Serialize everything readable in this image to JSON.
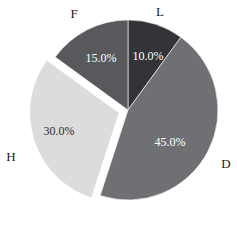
{
  "chart_data": {
    "type": "pie",
    "title": "",
    "categories": [
      "L",
      "D",
      "H",
      "F"
    ],
    "values": [
      10.0,
      45.0,
      30.0,
      15.0
    ],
    "value_labels": [
      "10.0%",
      "45.0%",
      "30.0%",
      "15.0%"
    ],
    "colors": [
      "#333438",
      "#6e7073",
      "#dcdcdc",
      "#58595c"
    ],
    "label_text_colors": [
      "#ffffff",
      "#ffffff",
      "#2b2b2b",
      "#ffffff"
    ],
    "exploded": [
      "H"
    ],
    "start_angle_deg": 90,
    "direction": "clockwise",
    "legend": "none",
    "grid": false,
    "slices": [
      {
        "name": "L",
        "value": 10.0,
        "value_label": "10.0%",
        "color": "#333438",
        "label_color": "#ffffff",
        "category_label_x": 160,
        "category_label_y": 11,
        "pct_x": 148,
        "pct_y": 57,
        "exploded": false
      },
      {
        "name": "D",
        "value": 45.0,
        "value_label": "45.0%",
        "color": "#6e7073",
        "label_color": "#ffffff",
        "category_label_x": 226,
        "category_label_y": 163,
        "pct_x": 170,
        "pct_y": 143,
        "exploded": false
      },
      {
        "name": "H",
        "value": 30.0,
        "value_label": "30.0%",
        "color": "#dcdcdc",
        "label_color": "#2b2b2b",
        "category_label_x": 11,
        "category_label_y": 156,
        "pct_x": 59,
        "pct_y": 132,
        "exploded": true
      },
      {
        "name": "F",
        "value": 15.0,
        "value_label": "15.0%",
        "color": "#58595c",
        "label_color": "#ffffff",
        "category_label_x": 74,
        "category_label_y": 13,
        "pct_x": 101,
        "pct_y": 59,
        "exploded": false
      }
    ],
    "geometry": {
      "center_x": 128,
      "center_y": 110,
      "radius": 90,
      "explode_offset": 9,
      "gap_color": "#ffffff"
    }
  }
}
